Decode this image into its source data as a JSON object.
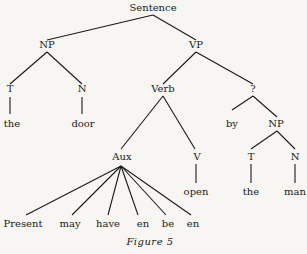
{
  "tree": {
    "nodes": [
      {
        "id": "sentence",
        "label": "Sentence",
        "x": 153,
        "y": 2
      },
      {
        "id": "np1",
        "label": "NP",
        "x": 47,
        "y": 39
      },
      {
        "id": "vp",
        "label": "VP",
        "x": 196,
        "y": 39
      },
      {
        "id": "t1",
        "label": "T",
        "x": 10,
        "y": 83
      },
      {
        "id": "n1",
        "label": "N",
        "x": 82,
        "y": 83
      },
      {
        "id": "verb",
        "label": "Verb",
        "x": 163,
        "y": 83
      },
      {
        "id": "q",
        "label": "?",
        "x": 253,
        "y": 83
      },
      {
        "id": "the1",
        "label": "the",
        "x": 12,
        "y": 118
      },
      {
        "id": "door",
        "label": "door",
        "x": 83,
        "y": 118
      },
      {
        "id": "by",
        "label": "by",
        "x": 232,
        "y": 118
      },
      {
        "id": "np2",
        "label": "NP",
        "x": 276,
        "y": 118
      },
      {
        "id": "aux",
        "label": "Aux",
        "x": 122,
        "y": 151
      },
      {
        "id": "v",
        "label": "V",
        "x": 197,
        "y": 151
      },
      {
        "id": "t2",
        "label": "T",
        "x": 251,
        "y": 151
      },
      {
        "id": "n2",
        "label": "N",
        "x": 295,
        "y": 151
      },
      {
        "id": "open",
        "label": "open",
        "x": 196,
        "y": 186
      },
      {
        "id": "the2",
        "label": "the",
        "x": 251,
        "y": 186
      },
      {
        "id": "man",
        "label": "man",
        "x": 295,
        "y": 186
      },
      {
        "id": "present",
        "label": "Present",
        "x": 23,
        "y": 218
      },
      {
        "id": "may",
        "label": "may",
        "x": 70,
        "y": 218
      },
      {
        "id": "have",
        "label": "have",
        "x": 108,
        "y": 218
      },
      {
        "id": "en1",
        "label": "en",
        "x": 143,
        "y": 218
      },
      {
        "id": "be",
        "label": "be",
        "x": 168,
        "y": 218
      },
      {
        "id": "en2",
        "label": "en",
        "x": 193,
        "y": 218
      }
    ],
    "edges": [
      [
        153,
        15,
        47,
        40
      ],
      [
        153,
        15,
        196,
        40
      ],
      [
        47,
        52,
        10,
        84
      ],
      [
        47,
        52,
        82,
        84
      ],
      [
        196,
        52,
        163,
        84
      ],
      [
        196,
        52,
        253,
        84
      ],
      [
        10,
        97,
        10,
        114
      ],
      [
        82,
        97,
        82,
        114
      ],
      [
        163,
        96,
        121,
        149
      ],
      [
        163,
        96,
        195,
        149
      ],
      [
        253,
        96,
        232,
        110
      ],
      [
        253,
        96,
        277,
        117
      ],
      [
        277,
        131,
        251,
        149
      ],
      [
        277,
        131,
        295,
        149
      ],
      [
        196,
        164,
        196,
        183
      ],
      [
        251,
        164,
        251,
        183
      ],
      [
        295,
        164,
        295,
        183
      ],
      [
        121,
        166,
        26,
        215
      ],
      [
        121,
        166,
        72,
        215
      ],
      [
        121,
        166,
        108,
        215
      ],
      [
        121,
        166,
        138,
        215
      ],
      [
        121,
        166,
        166,
        215
      ],
      [
        121,
        166,
        191,
        215
      ]
    ]
  },
  "caption": "Figure 5"
}
